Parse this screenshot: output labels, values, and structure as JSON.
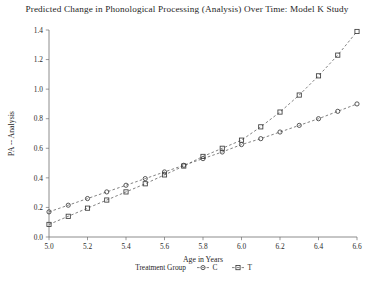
{
  "chart_data": {
    "type": "line",
    "title": "Predicted Change in Phonological Processing (Analysis) Over Time: Model K Study",
    "xlabel": "Age in Years",
    "ylabel": "PA -- Analysis",
    "xlim": [
      5.0,
      6.6
    ],
    "ylim": [
      0.0,
      1.4
    ],
    "xticks": [
      "5.0",
      "5.2",
      "5.4",
      "5.6",
      "5.8",
      "6.0",
      "6.2",
      "6.4",
      "6.6"
    ],
    "xtick_values": [
      5.0,
      5.2,
      5.4,
      5.6,
      5.8,
      6.0,
      6.2,
      6.4,
      6.6
    ],
    "yticks": [
      "0.0",
      "0.2",
      "0.4",
      "0.6",
      "0.8",
      "1.0",
      "1.2",
      "1.4"
    ],
    "ytick_values": [
      0.0,
      0.2,
      0.4,
      0.6,
      0.8,
      1.0,
      1.2,
      1.4
    ],
    "grid": false,
    "legend_position": "bottom",
    "legend_title": "Treatment Group",
    "series": [
      {
        "name": "C",
        "marker": "circle",
        "linestyle": "dashed",
        "x": [
          5.0,
          5.1,
          5.2,
          5.3,
          5.4,
          5.5,
          5.6,
          5.7,
          5.8,
          5.9,
          6.0,
          6.1,
          6.2,
          6.3,
          6.4,
          6.5,
          6.6
        ],
        "values": [
          0.17,
          0.215,
          0.26,
          0.305,
          0.35,
          0.395,
          0.44,
          0.485,
          0.53,
          0.575,
          0.625,
          0.665,
          0.71,
          0.755,
          0.8,
          0.85,
          0.9
        ]
      },
      {
        "name": "T",
        "marker": "square",
        "linestyle": "dashed",
        "x": [
          5.0,
          5.1,
          5.2,
          5.3,
          5.4,
          5.5,
          5.6,
          5.7,
          5.8,
          5.9,
          6.0,
          6.1,
          6.2,
          6.3,
          6.4,
          6.5,
          6.6
        ],
        "values": [
          0.085,
          0.14,
          0.195,
          0.25,
          0.305,
          0.36,
          0.42,
          0.48,
          0.545,
          0.6,
          0.655,
          0.745,
          0.845,
          0.96,
          1.09,
          1.23,
          1.39
        ]
      }
    ]
  },
  "legend": {
    "title": "Treatment Group",
    "entries": [
      {
        "marker_name": "circle-marker",
        "label": "C"
      },
      {
        "marker_name": "square-marker",
        "label": "T"
      }
    ]
  },
  "colors": {
    "axis": "#6e6e6e",
    "series": "#585858",
    "marker": "#3c3c3c",
    "text": "#1f1f1f",
    "background": "#ffffff"
  }
}
